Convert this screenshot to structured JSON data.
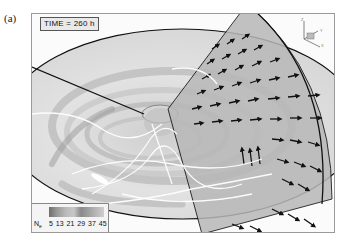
{
  "figure": {
    "panel_label": "(a)",
    "time_label": "TIME = 260 h",
    "axes_triad": {
      "z": "Z",
      "y": "Y",
      "x": "X"
    },
    "legend": {
      "variable": "N",
      "variable_subscript": "e",
      "ticks": "5  13 21 29 37 45",
      "tick_values": [
        5,
        13,
        21,
        29,
        37,
        45
      ],
      "colormap": "grayscale"
    },
    "colors": {
      "frame_border": "#9a9a9a",
      "disk_fill": "#dedede",
      "sector_fill": "#b8b8b8",
      "arrows": "#111111",
      "field_lines": "#ffffff"
    }
  }
}
